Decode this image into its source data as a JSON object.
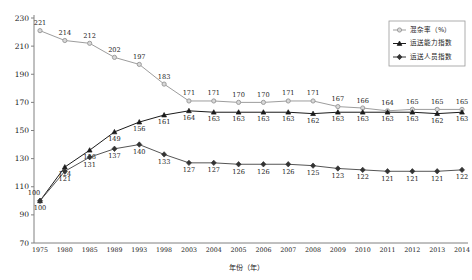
{
  "chart_data": {
    "type": "line",
    "title": "",
    "xlabel": "年份（年）",
    "ylabel": "",
    "ylim": [
      70,
      230
    ],
    "yticks": [
      70,
      90,
      110,
      130,
      150,
      170,
      190,
      210,
      230
    ],
    "grid": false,
    "legend_position": "top-right",
    "categories": [
      "1975",
      "1980",
      "1985",
      "1989",
      "1993",
      "1998",
      "2003",
      "2004",
      "2005",
      "2006",
      "2007",
      "2008",
      "2009",
      "2010",
      "2011",
      "2012",
      "2013",
      "2014"
    ],
    "series": [
      {
        "name": "混杂率（%）",
        "marker": "circle",
        "color": "#9d9d9d",
        "values": [
          221,
          214,
          212,
          202,
          197,
          183,
          171,
          171,
          170,
          170,
          171,
          171,
          167,
          166,
          164,
          165,
          165,
          165
        ]
      },
      {
        "name": "运送能力指数",
        "marker": "triangle",
        "color": "#1a1a1a",
        "values": [
          100,
          124,
          136,
          149,
          156,
          161,
          164,
          163,
          163,
          163,
          163,
          162,
          163,
          163,
          163,
          163,
          162,
          163
        ]
      },
      {
        "name": "运送人员指数",
        "marker": "diamond",
        "color": "#333333",
        "values": [
          100,
          121,
          131,
          137,
          140,
          133,
          127,
          127,
          126,
          126,
          126,
          125,
          123,
          122,
          121,
          121,
          121,
          122
        ]
      }
    ]
  },
  "legend": {
    "items": [
      {
        "label": "混杂率（%）"
      },
      {
        "label": "运送能力指数"
      },
      {
        "label": "运送人员指数"
      }
    ]
  },
  "axes": {
    "x_title": "年份（年）",
    "y_ticks": [
      "230",
      "210",
      "190",
      "170",
      "150",
      "130",
      "110",
      "90",
      "70"
    ],
    "x_ticks": [
      "1975",
      "1980",
      "1985",
      "1989",
      "1993",
      "1998",
      "2003",
      "2004",
      "2005",
      "2006",
      "2007",
      "2008",
      "2009",
      "2010",
      "2011",
      "2012",
      "2013",
      "2014"
    ]
  }
}
